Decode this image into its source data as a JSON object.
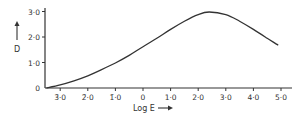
{
  "chart_data": {
    "type": "line",
    "title": "",
    "xlabel": "Log E",
    "ylabel": "D",
    "xlim": [
      -3.6,
      5.3
    ],
    "ylim": [
      0,
      3.1
    ],
    "grid": false,
    "legend": null,
    "x_ticks": [
      {
        "value": -3,
        "label": "3̄·0"
      },
      {
        "value": -2,
        "label": "2̄·0"
      },
      {
        "value": -1,
        "label": "1̄·0"
      },
      {
        "value": 0,
        "label": "0"
      },
      {
        "value": 1,
        "label": "1·0"
      },
      {
        "value": 2,
        "label": "2·0"
      },
      {
        "value": 3,
        "label": "3·0"
      },
      {
        "value": 4,
        "label": "4·0"
      },
      {
        "value": 5,
        "label": "5·0"
      }
    ],
    "y_ticks": [
      {
        "value": 0,
        "label": "0"
      },
      {
        "value": 1,
        "label": "1·0"
      },
      {
        "value": 2,
        "label": "2·0"
      },
      {
        "value": 3,
        "label": "3·0"
      }
    ],
    "series": [
      {
        "name": "D vs Log E",
        "x": [
          -3.5,
          -3.0,
          -2.5,
          -2.0,
          -1.5,
          -1.0,
          -0.5,
          0.0,
          0.5,
          1.0,
          1.5,
          2.0,
          2.4,
          3.0,
          3.5,
          4.0,
          4.5,
          4.9
        ],
        "y": [
          0.0,
          0.12,
          0.28,
          0.48,
          0.72,
          0.98,
          1.28,
          1.62,
          1.95,
          2.3,
          2.62,
          2.88,
          2.98,
          2.88,
          2.62,
          2.3,
          1.95,
          1.68
        ]
      }
    ],
    "annotations": [
      "D ↑ (y-axis arrow)",
      "Log E → (x-axis arrow)"
    ]
  },
  "labels": {
    "x_title": "Log E",
    "y_title": "D"
  }
}
